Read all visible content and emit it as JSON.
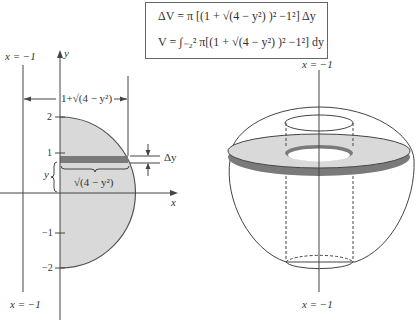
{
  "formulas": {
    "delta_v": "ΔV = π [(1 + √(4 − y²) )² −1²] Δy",
    "volume": "V = ∫₋₂² π[(1 + √(4 − y²) )² −1²] dy"
  },
  "left_diagram": {
    "axis_y_label": "y",
    "axis_x_label": "x",
    "line_label_top": "x = −1",
    "line_label_bottom": "x = −1",
    "width_label": "1+√(4 − y²)",
    "inner_width_label": "√(4 − y²)",
    "height_label": "y",
    "delta_label": "Δy",
    "ticks": [
      "2",
      "1",
      "−1",
      "−2"
    ]
  },
  "right_diagram": {
    "line_label_top": "x = −1",
    "line_label_bottom": "x = −1"
  },
  "colors": {
    "region_fill": "#d9d9d9",
    "strip_fill": "#7a7a7a",
    "line": "#444444"
  }
}
